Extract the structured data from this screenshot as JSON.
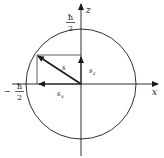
{
  "diagram": {
    "title": "",
    "axes": {
      "x_label": "x",
      "z_label": "z"
    },
    "labels": {
      "top_hbar": "ħ",
      "top_den": "2",
      "left_minus": "−",
      "left_hbar": "ħ",
      "left_den": "2",
      "vector": "s",
      "sz_main": "s",
      "sz_sub": "z",
      "sx_main": "s",
      "sx_sub": "x"
    },
    "geometry": {
      "center": [
        81,
        84
      ],
      "radius": 55,
      "vector_tip": [
        37,
        55
      ]
    },
    "colors": {
      "stroke": "#1a1a1a",
      "background": "#ffffff"
    }
  }
}
